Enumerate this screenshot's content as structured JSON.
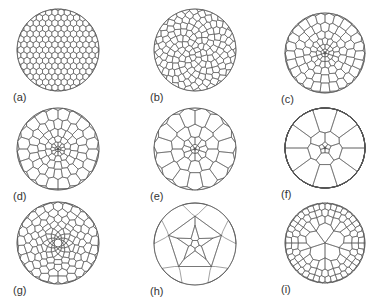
{
  "figure": {
    "stroke_color": "#555555",
    "background": "#ffffff",
    "panels": [
      {
        "id": "a",
        "label": "(a)",
        "cx": 58,
        "cy": 50,
        "r": 41,
        "pattern": "hex-grid",
        "cell": 6.2,
        "center_defect": false,
        "seed": 1,
        "gradient": 0
      },
      {
        "id": "b",
        "label": "(b)",
        "cx": 195,
        "cy": 50,
        "r": 41,
        "pattern": "spiral",
        "cell": 6.8,
        "center_defect": false,
        "seed": 2,
        "gradient": 0.25
      },
      {
        "id": "c",
        "label": "(c)",
        "cx": 325,
        "cy": 53,
        "r": 40,
        "pattern": "radial",
        "rings": 6,
        "inner": 5,
        "center_defect": true,
        "gradient": 1.1
      },
      {
        "id": "d",
        "label": "(d)",
        "cx": 58,
        "cy": 149,
        "r": 41,
        "pattern": "radial",
        "rings": 6,
        "inner": 5,
        "center_defect": true,
        "gradient": 1.6
      },
      {
        "id": "e",
        "label": "(e)",
        "cx": 195,
        "cy": 149,
        "r": 41,
        "pattern": "radial",
        "rings": 4,
        "inner": 5,
        "center_defect": true,
        "gradient": 2.0
      },
      {
        "id": "f",
        "label": "(f)",
        "cx": 325,
        "cy": 148,
        "r": 40,
        "pattern": "radial",
        "rings": 3,
        "inner": 5,
        "center_defect": true,
        "gradient": 3.0
      },
      {
        "id": "g",
        "label": "(g)",
        "cx": 58,
        "cy": 243,
        "r": 41,
        "pattern": "radial",
        "rings": 9,
        "inner": 10,
        "center_defect": true,
        "hole": 4,
        "gradient": 1.9
      },
      {
        "id": "h",
        "label": "(h)",
        "cx": 195,
        "cy": 244,
        "r": 41,
        "pattern": "pentagon",
        "center_defect": false
      },
      {
        "id": "i",
        "label": "(i)",
        "cx": 325,
        "cy": 243,
        "r": 40,
        "pattern": "radial",
        "rings": 4,
        "inner": 5,
        "center_defect": false,
        "gradient": -1.2
      }
    ]
  }
}
